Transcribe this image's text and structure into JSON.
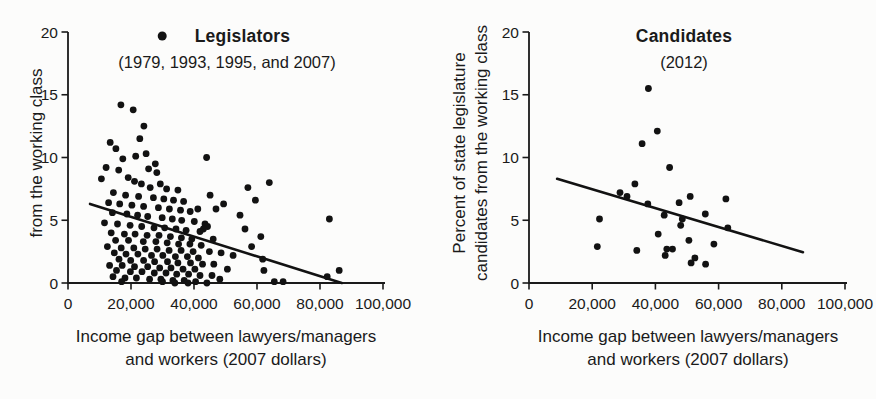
{
  "figure": {
    "background": "#fcfcfb",
    "ink_color": "#1a1a1a",
    "dot_color": "#121212"
  },
  "chart_data": [
    {
      "id": "legislators",
      "type": "scatter",
      "title": "Legislators",
      "subtitle": "(1979, 1993, 1995, and 2007)",
      "has_legend_dot": true,
      "legend_position": "top-center",
      "xlabel_lines": [
        "Income gap between lawyers/managers",
        "and workers (2007 dollars)"
      ],
      "ylabel_lines": [
        "from the working class"
      ],
      "xlim": [
        0,
        100000
      ],
      "ylim": [
        0,
        20
      ],
      "xtick_values": [
        0,
        20000,
        40000,
        60000,
        80000,
        100000
      ],
      "xtick_labels": [
        "0",
        "20,000",
        "40,000",
        "60,000",
        "80,000",
        "100,000"
      ],
      "ytick_values": [
        0,
        5,
        10,
        15,
        20
      ],
      "ytick_labels": [
        "0",
        "5",
        "10",
        "15",
        "20"
      ],
      "grid": false,
      "trend_line": {
        "x1": 7000,
        "y1": 6.3,
        "x2": 86900,
        "y2": 0.0
      },
      "points": [
        [
          16800,
          14.2
        ],
        [
          20700,
          13.8
        ],
        [
          24100,
          12.5
        ],
        [
          22800,
          11.5
        ],
        [
          13400,
          11.2
        ],
        [
          15200,
          10.7
        ],
        [
          24800,
          10.3
        ],
        [
          21500,
          10.1
        ],
        [
          44000,
          10.0
        ],
        [
          17400,
          9.9
        ],
        [
          27700,
          9.5
        ],
        [
          12100,
          9.2
        ],
        [
          25600,
          9.1
        ],
        [
          16100,
          9.0
        ],
        [
          28200,
          8.8
        ],
        [
          19100,
          8.4
        ],
        [
          10600,
          8.3
        ],
        [
          21100,
          8.1
        ],
        [
          63900,
          8.0
        ],
        [
          23300,
          7.9
        ],
        [
          29300,
          7.9
        ],
        [
          26100,
          7.6
        ],
        [
          57100,
          7.6
        ],
        [
          31300,
          7.5
        ],
        [
          34900,
          7.4
        ],
        [
          14400,
          7.2
        ],
        [
          18300,
          7.0
        ],
        [
          45100,
          7.0
        ],
        [
          22400,
          6.9
        ],
        [
          27100,
          6.8
        ],
        [
          30400,
          6.7
        ],
        [
          59500,
          6.6
        ],
        [
          33500,
          6.6
        ],
        [
          36700,
          6.5
        ],
        [
          12900,
          6.4
        ],
        [
          16400,
          6.3
        ],
        [
          49400,
          6.3
        ],
        [
          20300,
          6.2
        ],
        [
          24000,
          6.1
        ],
        [
          28700,
          6.0
        ],
        [
          32200,
          5.9
        ],
        [
          41200,
          5.9
        ],
        [
          47000,
          5.9
        ],
        [
          35700,
          5.8
        ],
        [
          38800,
          5.7
        ],
        [
          14100,
          5.6
        ],
        [
          18700,
          5.5
        ],
        [
          22100,
          5.4
        ],
        [
          54600,
          5.4
        ],
        [
          25300,
          5.3
        ],
        [
          29900,
          5.2
        ],
        [
          33100,
          5.1
        ],
        [
          83000,
          5.1
        ],
        [
          36100,
          5.0
        ],
        [
          40100,
          4.9
        ],
        [
          11600,
          4.8
        ],
        [
          15700,
          4.7
        ],
        [
          43500,
          4.7
        ],
        [
          19700,
          4.6
        ],
        [
          23400,
          4.5
        ],
        [
          44300,
          4.5
        ],
        [
          27300,
          4.4
        ],
        [
          30700,
          4.4
        ],
        [
          56200,
          4.3
        ],
        [
          34300,
          4.3
        ],
        [
          43000,
          4.3
        ],
        [
          37500,
          4.2
        ],
        [
          41900,
          4.1
        ],
        [
          13700,
          4.0
        ],
        [
          17900,
          3.9
        ],
        [
          21300,
          3.9
        ],
        [
          25100,
          3.8
        ],
        [
          28900,
          3.8
        ],
        [
          61200,
          3.7
        ],
        [
          32500,
          3.7
        ],
        [
          36000,
          3.6
        ],
        [
          39300,
          3.5
        ],
        [
          46100,
          3.5
        ],
        [
          15100,
          3.4
        ],
        [
          19200,
          3.4
        ],
        [
          23900,
          3.3
        ],
        [
          27900,
          3.3
        ],
        [
          31500,
          3.2
        ],
        [
          35100,
          3.1
        ],
        [
          38700,
          3.1
        ],
        [
          42300,
          3.0
        ],
        [
          58300,
          2.9
        ],
        [
          12500,
          2.9
        ],
        [
          16900,
          2.8
        ],
        [
          20900,
          2.8
        ],
        [
          24500,
          2.7
        ],
        [
          28300,
          2.7
        ],
        [
          32100,
          2.6
        ],
        [
          35900,
          2.6
        ],
        [
          39700,
          2.5
        ],
        [
          44900,
          2.5
        ],
        [
          48600,
          2.4
        ],
        [
          14700,
          2.4
        ],
        [
          18400,
          2.3
        ],
        [
          22200,
          2.3
        ],
        [
          26500,
          2.2
        ],
        [
          52400,
          2.2
        ],
        [
          30100,
          2.2
        ],
        [
          34100,
          2.1
        ],
        [
          37900,
          2.1
        ],
        [
          41400,
          2.0
        ],
        [
          61800,
          1.9
        ],
        [
          16200,
          1.9
        ],
        [
          19900,
          1.8
        ],
        [
          24000,
          1.8
        ],
        [
          27500,
          1.7
        ],
        [
          31600,
          1.7
        ],
        [
          34900,
          1.6
        ],
        [
          38900,
          1.6
        ],
        [
          42700,
          1.5
        ],
        [
          46300,
          1.5
        ],
        [
          13200,
          1.4
        ],
        [
          17200,
          1.4
        ],
        [
          21100,
          1.3
        ],
        [
          25300,
          1.3
        ],
        [
          29100,
          1.2
        ],
        [
          32700,
          1.2
        ],
        [
          36500,
          1.1
        ],
        [
          50600,
          1.1
        ],
        [
          40300,
          1.1
        ],
        [
          62200,
          1.0
        ],
        [
          86100,
          1.0
        ],
        [
          15400,
          1.0
        ],
        [
          19800,
          0.9
        ],
        [
          23500,
          0.9
        ],
        [
          27400,
          0.8
        ],
        [
          31100,
          0.8
        ],
        [
          34500,
          0.7
        ],
        [
          38300,
          0.7
        ],
        [
          41900,
          0.6
        ],
        [
          45700,
          0.6
        ],
        [
          82300,
          0.5
        ],
        [
          14300,
          0.5
        ],
        [
          18100,
          0.4
        ],
        [
          21700,
          0.4
        ],
        [
          25900,
          0.3
        ],
        [
          48200,
          0.3
        ],
        [
          29500,
          0.3
        ],
        [
          33300,
          0.2
        ],
        [
          36900,
          0.2
        ],
        [
          40500,
          0.1
        ],
        [
          65500,
          0.1
        ],
        [
          68300,
          0.1
        ],
        [
          17000,
          0.1
        ],
        [
          30000,
          0.1
        ],
        [
          33900,
          0.0
        ],
        [
          38100,
          0.0
        ],
        [
          44100,
          0.0
        ]
      ]
    },
    {
      "id": "candidates",
      "type": "scatter",
      "title": "Candidates",
      "subtitle": "(2012)",
      "has_legend_dot": false,
      "xlabel_lines": [
        "Income gap between lawyers/managers",
        "and workers (2007 dollars)"
      ],
      "ylabel_lines": [
        "Percent of state legislature",
        "candidates from the working class"
      ],
      "xlim": [
        0,
        100000
      ],
      "ylim": [
        0,
        20
      ],
      "xtick_values": [
        0,
        20000,
        40000,
        60000,
        80000,
        100000
      ],
      "xtick_labels": [
        "0",
        "20,000",
        "40,000",
        "60,000",
        "80,000",
        "100,000"
      ],
      "ytick_values": [
        0,
        5,
        10,
        15,
        20
      ],
      "ytick_labels": [
        "0",
        "5",
        "10",
        "15",
        "20"
      ],
      "grid": false,
      "trend_line": {
        "x1": 8900,
        "y1": 8.3,
        "x2": 86700,
        "y2": 2.45
      },
      "points": [
        [
          37800,
          15.5
        ],
        [
          40600,
          12.1
        ],
        [
          35800,
          11.1
        ],
        [
          44500,
          9.2
        ],
        [
          33500,
          7.9
        ],
        [
          28800,
          7.2
        ],
        [
          31000,
          6.9
        ],
        [
          37600,
          6.3
        ],
        [
          47500,
          6.4
        ],
        [
          51000,
          6.9
        ],
        [
          62300,
          6.7
        ],
        [
          55800,
          5.5
        ],
        [
          42800,
          5.4
        ],
        [
          22300,
          5.1
        ],
        [
          48500,
          5.1
        ],
        [
          48000,
          4.6
        ],
        [
          62900,
          4.4
        ],
        [
          40900,
          3.9
        ],
        [
          50600,
          3.4
        ],
        [
          58500,
          3.1
        ],
        [
          21600,
          2.9
        ],
        [
          34100,
          2.6
        ],
        [
          43600,
          2.7
        ],
        [
          45400,
          2.7
        ],
        [
          43100,
          2.2
        ],
        [
          52500,
          2.0
        ],
        [
          51300,
          1.6
        ],
        [
          55900,
          1.5
        ]
      ]
    }
  ]
}
